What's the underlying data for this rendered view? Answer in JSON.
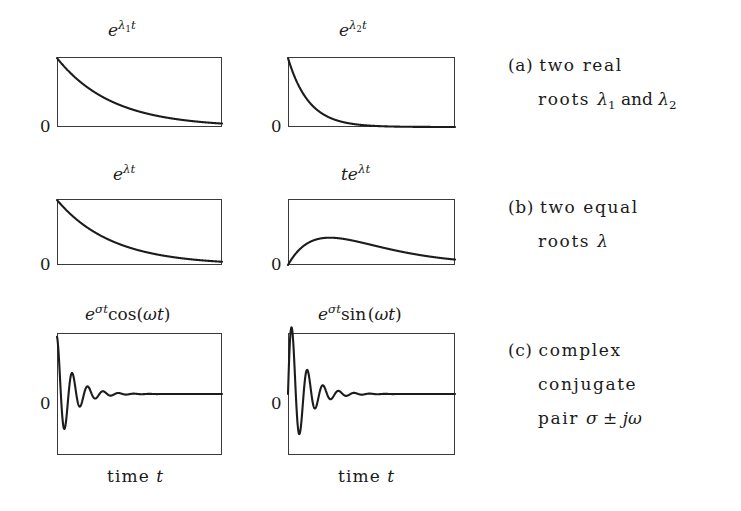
{
  "figure": {
    "background_color": "#ffffff",
    "ink_color": "#1c1c1c",
    "frame_color": "#3a3a3a"
  },
  "panels": [
    {
      "id": "exp-lambda1-t",
      "title_html": "<span class=\"mvar\">e</span><span class=\"msup\">λ<span class=\"msub\">1</span><span class=\"mvar\">t</span></span>",
      "title_text": "e^{λ₁ t}",
      "zero_label": "0",
      "curve": "exp_decay",
      "params": {
        "rate": 3.0,
        "amplitude": 1.0
      },
      "baseline": "bottom",
      "box": {
        "x": 57,
        "y": 57,
        "w": 165,
        "h": 70
      },
      "title_pos": {
        "x": 108,
        "y": 22
      },
      "zero_pos": {
        "x": 40,
        "y": 119
      }
    },
    {
      "id": "exp-lambda2-t",
      "title_html": "<span class=\"mvar\">e</span><span class=\"msup\">λ<span class=\"msub\">2</span><span class=\"mvar\">t</span></span>",
      "title_text": "e^{λ₂ t}",
      "zero_label": "0",
      "curve": "exp_decay",
      "params": {
        "rate": 8.0,
        "amplitude": 1.0
      },
      "baseline": "bottom",
      "box": {
        "x": 288,
        "y": 57,
        "w": 167,
        "h": 70
      },
      "title_pos": {
        "x": 339,
        "y": 22
      },
      "zero_pos": {
        "x": 271,
        "y": 119
      }
    },
    {
      "id": "exp-lambda-t",
      "title_html": "<span class=\"mvar\">e</span><span class=\"msup\">λ<span class=\"mvar\">t</span></span>",
      "title_text": "e^{λ t}",
      "zero_label": "0",
      "curve": "exp_decay",
      "params": {
        "rate": 3.0,
        "amplitude": 1.0
      },
      "baseline": "bottom",
      "box": {
        "x": 57,
        "y": 199,
        "w": 165,
        "h": 66
      },
      "title_pos": {
        "x": 113,
        "y": 166
      },
      "zero_pos": {
        "x": 40,
        "y": 257
      }
    },
    {
      "id": "t-exp-lambda-t",
      "title_html": "<span class=\"mvar\">t</span><span class=\"mvar\">e</span><span class=\"msup\">λ<span class=\"mvar\">t</span></span>",
      "title_text": "t e^{λ t}",
      "zero_label": "0",
      "curve": "t_exp_decay",
      "params": {
        "rate": 4.0,
        "amplitude": 1.0,
        "peak_height": 0.42
      },
      "baseline": "bottom",
      "box": {
        "x": 288,
        "y": 199,
        "w": 167,
        "h": 66
      },
      "title_pos": {
        "x": 341,
        "y": 166
      },
      "zero_pos": {
        "x": 271,
        "y": 257
      }
    },
    {
      "id": "damped-cosine",
      "title_html": "<span class=\"mvar\">e</span><span class=\"msup\">σ<span class=\"mvar\">t</span></span><span class=\"mop\">cos(</span><span class=\"mvar\">ωt</span><span class=\"mop\">)</span>",
      "title_text": "e^{σt}cos(ωt)",
      "zero_label": "0",
      "curve": "damped_cos",
      "params": {
        "decay": 3.4,
        "omega": 21.0,
        "amplitude": 1.0
      },
      "baseline": "middle",
      "box": {
        "x": 57,
        "y": 333,
        "w": 165,
        "h": 122
      },
      "title_pos": {
        "x": 85,
        "y": 306
      },
      "zero_pos": {
        "x": 40,
        "y": 396
      }
    },
    {
      "id": "damped-sine",
      "title_html": "<span class=\"mvar\">e</span><span class=\"msup\">σ<span class=\"mvar\">t</span></span><span class=\"mop\">sin&#8202;(</span><span class=\"mvar\">ωt</span><span class=\"mop\">)</span>",
      "title_text": "e^{σt}sin(ωt)",
      "zero_label": "0",
      "curve": "damped_sin",
      "params": {
        "decay": 3.4,
        "omega": 21.0,
        "amplitude": 1.48
      },
      "baseline": "middle",
      "box": {
        "x": 288,
        "y": 333,
        "w": 167,
        "h": 122
      },
      "title_pos": {
        "x": 318,
        "y": 306
      },
      "zero_pos": {
        "x": 271,
        "y": 396
      }
    }
  ],
  "axis_labels": [
    {
      "id": "time-axis-left",
      "text": "time ",
      "symbol": "t",
      "pos": {
        "x": 107,
        "y": 466
      }
    },
    {
      "id": "time-axis-right",
      "text": "time ",
      "symbol": "t",
      "pos": {
        "x": 338,
        "y": 466
      }
    }
  ],
  "captions": [
    {
      "id": "caption-a",
      "tag": "(a)",
      "lines": [
        {
          "text": "two real",
          "symbols": ""
        },
        {
          "text": "roots ",
          "symbols": "λ₁ and λ₂",
          "indent": true
        }
      ],
      "pos": {
        "x": 508,
        "y": 57
      }
    },
    {
      "id": "caption-b",
      "tag": "(b)",
      "lines": [
        {
          "text": "two equal",
          "symbols": ""
        },
        {
          "text": "roots ",
          "symbols": "λ",
          "indent": true
        }
      ],
      "pos": {
        "x": 508,
        "y": 199
      }
    },
    {
      "id": "caption-c",
      "tag": "(c)",
      "lines": [
        {
          "text": "complex",
          "symbols": ""
        },
        {
          "text": "conjugate",
          "symbols": "",
          "indent": true
        },
        {
          "text": "pair ",
          "symbols": "σ ± jω",
          "indent": true
        }
      ],
      "pos": {
        "x": 508,
        "y": 342
      }
    }
  ],
  "chart_data": {
    "type": "line",
    "xlabel": "time t",
    "ylabel": "",
    "grid": false,
    "legend": "none",
    "panels": [
      {
        "name": "e^{λ₁ t}",
        "function": "exp(-3.0*x)",
        "x": [
          0,
          0.1,
          0.2,
          0.3,
          0.4,
          0.5,
          0.6,
          0.7,
          0.8,
          0.9,
          1.0
        ],
        "y": [
          1.0,
          0.741,
          0.549,
          0.407,
          0.301,
          0.223,
          0.165,
          0.122,
          0.091,
          0.067,
          0.05
        ],
        "xlim": [
          0,
          1
        ],
        "ylim": [
          0,
          1
        ]
      },
      {
        "name": "e^{λ₂ t}",
        "function": "exp(-8.0*x)",
        "x": [
          0,
          0.1,
          0.2,
          0.3,
          0.4,
          0.5,
          0.6,
          0.7,
          0.8,
          0.9,
          1.0
        ],
        "y": [
          1.0,
          0.449,
          0.202,
          0.091,
          0.041,
          0.018,
          0.008,
          0.004,
          0.002,
          0.001,
          0.0
        ],
        "xlim": [
          0,
          1
        ],
        "ylim": [
          0,
          1
        ]
      },
      {
        "name": "e^{λ t}",
        "function": "exp(-3.0*x)",
        "x": [
          0,
          0.1,
          0.2,
          0.3,
          0.4,
          0.5,
          0.6,
          0.7,
          0.8,
          0.9,
          1.0
        ],
        "y": [
          1.0,
          0.741,
          0.549,
          0.407,
          0.301,
          0.223,
          0.165,
          0.122,
          0.091,
          0.067,
          0.05
        ],
        "xlim": [
          0,
          1
        ],
        "ylim": [
          0,
          1
        ]
      },
      {
        "name": "t e^{λ t}",
        "function": "4*x*exp(-4.0*x)*e/1",
        "x": [
          0,
          0.1,
          0.2,
          0.25,
          0.3,
          0.4,
          0.5,
          0.6,
          0.7,
          0.8,
          0.9,
          1.0
        ],
        "y": [
          0.0,
          0.268,
          0.359,
          0.368,
          0.361,
          0.323,
          0.271,
          0.218,
          0.171,
          0.131,
          0.099,
          0.073
        ],
        "xlim": [
          0,
          1
        ],
        "ylim": [
          0,
          1
        ]
      },
      {
        "name": "e^{σt}cos(ωt)",
        "function": "exp(-3.4*x)*cos(21*x)",
        "x": [
          0,
          0.05,
          0.1,
          0.15,
          0.2,
          0.25,
          0.3,
          0.4,
          0.5,
          0.7,
          1.0
        ],
        "y": [
          1.0,
          0.42,
          -0.55,
          -0.48,
          0.25,
          0.42,
          -0.05,
          -0.19,
          0.08,
          0.04,
          0.0
        ],
        "xlim": [
          0,
          1
        ],
        "ylim": [
          -1,
          1
        ]
      },
      {
        "name": "e^{σt}sin(ωt)",
        "function": "exp(-3.4*x)*sin(21*x)",
        "x": [
          0,
          0.05,
          0.1,
          0.15,
          0.2,
          0.25,
          0.3,
          0.4,
          0.5,
          0.7,
          1.0
        ],
        "y": [
          0.0,
          0.73,
          0.35,
          -0.38,
          -0.41,
          0.09,
          0.25,
          -0.07,
          -0.11,
          0.02,
          0.0
        ],
        "xlim": [
          0,
          1
        ],
        "ylim": [
          -1,
          1
        ]
      }
    ]
  }
}
